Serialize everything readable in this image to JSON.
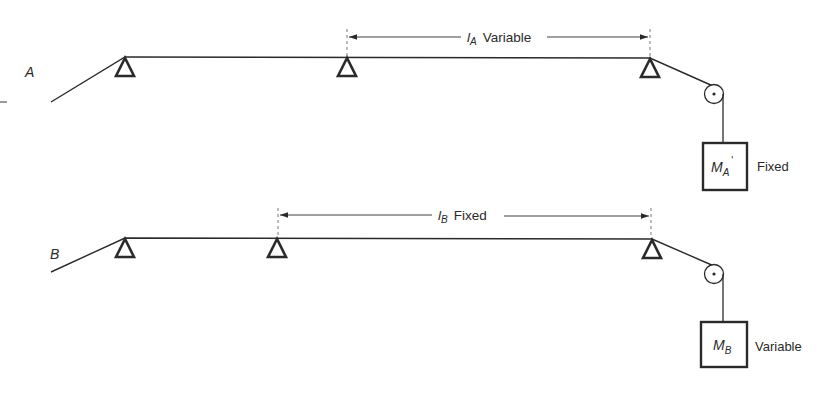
{
  "diagram": {
    "type": "mechanical-setup",
    "colors": {
      "ink": "#2a2a2a",
      "background": "#ffffff"
    },
    "setups": [
      {
        "id": "A",
        "label": "A",
        "span_symbol": "l",
        "span_subscript": "A",
        "span_note": "Variable",
        "mass_symbol": "M",
        "mass_subscript": "A",
        "mass_prime": "'",
        "mass_note": "Fixed",
        "supports": 3
      },
      {
        "id": "B",
        "label": "B",
        "span_symbol": "l",
        "span_subscript": "B",
        "span_note": "Fixed",
        "mass_symbol": "M",
        "mass_subscript": "B",
        "mass_note": "Variable",
        "supports": 3
      }
    ]
  }
}
